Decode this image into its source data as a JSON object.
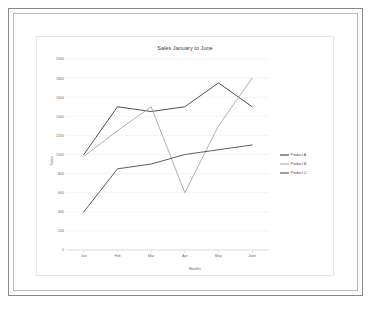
{
  "chart_data": {
    "type": "line",
    "title": "Sales January to June",
    "xlabel": "Months",
    "ylabel": "Sales",
    "categories": [
      "Jan",
      "Feb",
      "Mar",
      "Apr",
      "May",
      "June"
    ],
    "ylim": [
      0,
      2000
    ],
    "yticks": [
      0,
      200,
      400,
      600,
      800,
      1000,
      1200,
      1400,
      1600,
      1800,
      2000
    ],
    "grid": true,
    "legend_position": "right",
    "series": [
      {
        "name": "Product A",
        "color": "#3a3a4f",
        "values": [
          1000,
          1500,
          1450,
          1500,
          1750,
          1500
        ]
      },
      {
        "name": "Product B",
        "color": "#a8a8a8",
        "values": [
          980,
          1250,
          1500,
          600,
          1300,
          1800
        ]
      },
      {
        "name": "Product C",
        "color": "#4a4a5a",
        "values": [
          400,
          850,
          900,
          1000,
          1050,
          1100
        ]
      }
    ]
  },
  "legend": {
    "entries": [
      {
        "label": "Product A"
      },
      {
        "label": "Product B"
      },
      {
        "label": "Product C"
      }
    ]
  }
}
